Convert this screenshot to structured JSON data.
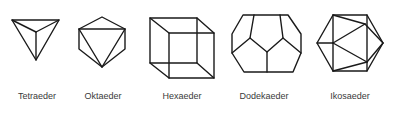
{
  "figure": {
    "stroke_color": "#1a1a1a",
    "text_color": "#3a3a3a",
    "solids": [
      {
        "id": "tetraeder",
        "label": "Tetraeder",
        "label_x": 37
      },
      {
        "id": "oktaeder",
        "label": "Oktaeder",
        "label_x": 103
      },
      {
        "id": "hexaeder",
        "label": "Hexaeder",
        "label_x": 182
      },
      {
        "id": "dodekaeder",
        "label": "Dodekaeder",
        "label_x": 264
      },
      {
        "id": "ikosaeder",
        "label": "Ikosaeder",
        "label_x": 350
      }
    ]
  }
}
